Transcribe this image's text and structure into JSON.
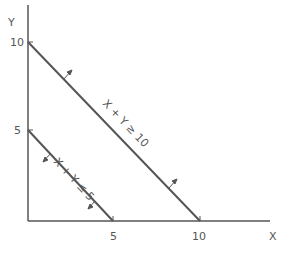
{
  "axes": {
    "x_label": "X",
    "y_label": "Y",
    "x_ticks": [
      "5",
      "10"
    ],
    "y_ticks": [
      "5",
      "10"
    ]
  },
  "constraints": [
    {
      "label": "X + Y ≥ 10",
      "x_intercept": 10,
      "y_intercept": 10,
      "direction": "away from origin"
    },
    {
      "label": "X + Y ≤ 5",
      "x_intercept": 5,
      "y_intercept": 5,
      "direction": "toward origin"
    }
  ],
  "colors": {
    "line": "#555555",
    "text": "#555555",
    "background": "#ffffff"
  }
}
